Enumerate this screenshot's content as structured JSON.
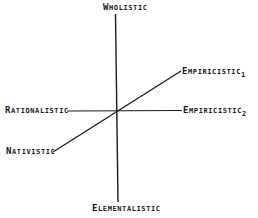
{
  "diagram": {
    "type": "axes-diagram",
    "axes": [
      {
        "id": "vertical",
        "from": "Wholistic",
        "to": "Elementalistic"
      },
      {
        "id": "horizontal",
        "from": "Rationalistic",
        "to": "Empiricistic",
        "to_subscript": "2"
      },
      {
        "id": "diagonal",
        "from": "Nativistic",
        "to": "Empiricistic",
        "to_subscript": "1"
      }
    ],
    "labels": {
      "top": {
        "cap": "W",
        "rest": "holistic"
      },
      "bottom": {
        "cap": "E",
        "rest": "lementalistic"
      },
      "left": {
        "cap": "R",
        "rest": "ationalistic"
      },
      "lower_left": {
        "cap": "N",
        "rest": "ativistic"
      },
      "right_upper": {
        "cap": "E",
        "rest": "mpiricistic",
        "sub": "1"
      },
      "right": {
        "cap": "E",
        "rest": "mpiricistic",
        "sub": "2"
      }
    },
    "line_color": "#1a1a1a",
    "background": "#ffffff"
  }
}
